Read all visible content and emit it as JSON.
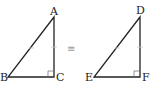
{
  "diagram": {
    "relation_symbol": "≡",
    "triangle_left": {
      "labels": {
        "A": "A",
        "B": "B",
        "C": "C"
      },
      "right_angle_at": "C"
    },
    "triangle_right": {
      "labels": {
        "D": "D",
        "E": "E",
        "F": "F"
      },
      "right_angle_at": "F"
    },
    "colors": {
      "stroke": "#222222",
      "tick": "#aaaaaa"
    }
  }
}
